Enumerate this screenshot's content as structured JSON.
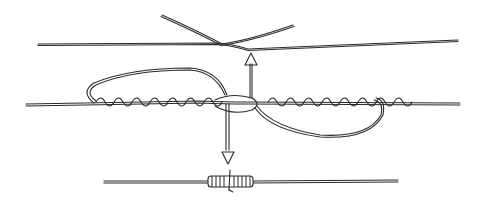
{
  "diagram": {
    "type": "knot-tying-illustration",
    "colors": {
      "ink": "#2a2a2a",
      "background": "#ffffff"
    },
    "steps": [
      {
        "name": "step-1-overlap",
        "label": ""
      },
      {
        "name": "step-2-wraps-and-pass-through",
        "label": ""
      },
      {
        "name": "step-3-finished-knot",
        "label": ""
      }
    ],
    "arrows": [
      {
        "name": "arrow-up",
        "direction": "up"
      },
      {
        "name": "arrow-down",
        "direction": "down"
      }
    ]
  }
}
